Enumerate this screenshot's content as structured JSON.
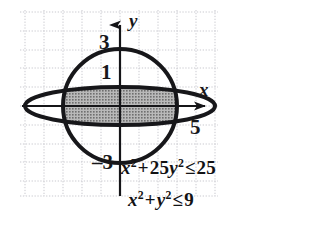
{
  "figure": {
    "type": "math-graph",
    "background_color": "#ffffff",
    "grid": {
      "style": "dotted",
      "color": "#c9c9cf",
      "cell_px": 19,
      "left": 20,
      "top": 10,
      "right": 218,
      "bottom": 196
    },
    "axes": {
      "color": "#151518",
      "origin_x": 120,
      "origin_y": 106,
      "x_label": "x",
      "y_label": "y",
      "x_arrow_tip": 215,
      "y_arrow_tip": 14
    },
    "curves": [
      {
        "name": "circle",
        "equation_label": "x^2 + y^2 = 9",
        "radius_units": 3,
        "radius_px": 57,
        "stroke": "#17171a",
        "stroke_px": 4
      },
      {
        "name": "ellipse",
        "equation_label": "x^2 + 25y^2 = 25",
        "semi_major_units": 5,
        "semi_minor_units": 1,
        "semi_major_px": 95,
        "semi_minor_px": 19,
        "stroke": "#17171a",
        "stroke_px": 4
      }
    ],
    "shaded_region": {
      "fill": "#9a9a9a",
      "pattern": "halftone-dots",
      "meaning": "points satisfying both inequalities"
    }
  },
  "labels": {
    "y_three": "3",
    "y_one": "1",
    "y_neg_three": "–3",
    "x_five": "5",
    "axis_x": "x",
    "axis_y": "y"
  },
  "equations": {
    "first": {
      "lhs_term1_base": "x",
      "lhs_term1_exp": "2",
      "plus": "+",
      "lhs_term2_coef": "25",
      "lhs_term2_base": "y",
      "lhs_term2_exp": "2",
      "relation": "≤",
      "rhs": "25",
      "plain": "x² + 25y² ≤ 25"
    },
    "second": {
      "lhs_term1_base": "x",
      "lhs_term1_exp": "2",
      "plus": "+",
      "lhs_term2_base": "y",
      "lhs_term2_exp": "2",
      "relation": "≤",
      "rhs": "9",
      "plain": "x² + y² ≤ 9"
    }
  }
}
